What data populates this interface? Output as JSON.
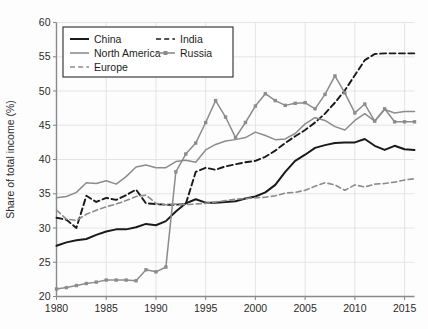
{
  "chart_data": {
    "type": "line",
    "title": "",
    "xlabel": "",
    "ylabel": "Share of total income (%)",
    "xlim": [
      1980,
      2016
    ],
    "ylim": [
      20,
      60
    ],
    "xticks": [
      1980,
      1985,
      1990,
      1995,
      2000,
      2005,
      2010,
      2015
    ],
    "yticks": [
      20,
      25,
      30,
      35,
      40,
      45,
      50,
      55,
      60
    ],
    "grid": true,
    "legend_position": "upper-left",
    "x": [
      1980,
      1981,
      1982,
      1983,
      1984,
      1985,
      1986,
      1987,
      1988,
      1989,
      1990,
      1991,
      1992,
      1993,
      1994,
      1995,
      1996,
      1997,
      1998,
      1999,
      2000,
      2001,
      2002,
      2003,
      2004,
      2005,
      2006,
      2007,
      2008,
      2009,
      2010,
      2011,
      2012,
      2013,
      2014,
      2015,
      2016
    ],
    "series": [
      {
        "name": "China",
        "style": "solid",
        "color": "#1a1a1a",
        "width": 2.0,
        "marker": "none",
        "values": [
          27.4,
          27.9,
          28.2,
          28.4,
          29.0,
          29.5,
          29.8,
          29.8,
          30.1,
          30.6,
          30.4,
          31.0,
          32.4,
          33.6,
          34.2,
          33.7,
          33.7,
          33.8,
          33.9,
          34.3,
          34.6,
          35.2,
          36.3,
          38.2,
          39.8,
          40.7,
          41.7,
          42.1,
          42.4,
          42.5,
          42.5,
          43.0,
          42.0,
          41.4,
          42.0,
          41.5,
          41.4
        ]
      },
      {
        "name": "India",
        "style": "dashed",
        "color": "#1a1a1a",
        "width": 1.9,
        "marker": "none",
        "values": [
          31.5,
          31.2,
          30.0,
          34.7,
          33.8,
          34.4,
          34.1,
          34.8,
          35.6,
          33.6,
          33.5,
          33.4,
          33.4,
          33.5,
          38.2,
          38.8,
          38.5,
          39.0,
          39.3,
          39.6,
          39.8,
          40.4,
          41.3,
          42.4,
          43.4,
          44.3,
          45.4,
          46.7,
          48.3,
          50.1,
          52.3,
          54.5,
          55.4,
          55.5,
          55.5,
          55.5,
          55.5
        ]
      },
      {
        "name": "North America",
        "style": "solid",
        "color": "#8c8c8c",
        "width": 1.5,
        "marker": "none",
        "values": [
          34.4,
          34.6,
          35.2,
          36.6,
          36.5,
          36.9,
          36.4,
          37.5,
          38.9,
          39.2,
          38.8,
          38.8,
          39.7,
          39.9,
          39.6,
          41.4,
          42.2,
          42.7,
          42.9,
          43.2,
          44.0,
          43.5,
          42.9,
          43.0,
          43.8,
          45.2,
          46.1,
          45.7,
          44.8,
          44.3,
          45.7,
          46.7,
          45.6,
          47.3,
          46.8,
          47.0,
          47.0
        ]
      },
      {
        "name": "Russia",
        "style": "solid",
        "color": "#8c8c8c",
        "width": 1.5,
        "marker": "square",
        "values": [
          21.1,
          21.3,
          21.6,
          21.9,
          22.1,
          22.4,
          22.4,
          22.4,
          22.3,
          23.9,
          23.6,
          24.3,
          38.2,
          40.8,
          42.4,
          45.4,
          48.6,
          46.2,
          43.2,
          45.4,
          47.8,
          49.6,
          48.6,
          47.9,
          48.2,
          48.3,
          47.4,
          49.5,
          52.2,
          49.7,
          46.8,
          48.1,
          45.6,
          47.4,
          45.5,
          45.5,
          45.5
        ]
      },
      {
        "name": "Europe",
        "style": "dashed",
        "color": "#8c8c8c",
        "width": 1.6,
        "marker": "none",
        "values": [
          32.6,
          31.3,
          31.1,
          32.0,
          32.6,
          33.1,
          33.5,
          34.0,
          34.6,
          34.8,
          33.6,
          33.4,
          33.5,
          33.4,
          33.5,
          33.6,
          33.8,
          34.0,
          34.2,
          34.3,
          34.4,
          34.5,
          34.7,
          35.1,
          35.2,
          35.5,
          36.1,
          36.6,
          36.3,
          35.5,
          36.3,
          36.0,
          36.4,
          36.5,
          36.7,
          37.0,
          37.2
        ]
      }
    ],
    "legend": [
      {
        "label": "China",
        "style": "solid",
        "color": "#1a1a1a",
        "marker": "none"
      },
      {
        "label": "India",
        "style": "dashed",
        "color": "#1a1a1a",
        "marker": "none"
      },
      {
        "label": "North America",
        "style": "solid",
        "color": "#8c8c8c",
        "marker": "none"
      },
      {
        "label": "Russia",
        "style": "solid",
        "color": "#8c8c8c",
        "marker": "square"
      },
      {
        "label": "Europe",
        "style": "dashed",
        "color": "#8c8c8c",
        "marker": "none"
      }
    ]
  }
}
